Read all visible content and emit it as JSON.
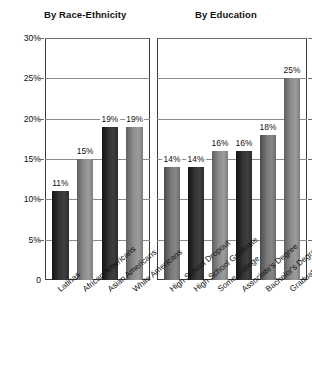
{
  "chart_data": {
    "type": "bar",
    "title": "",
    "xlabel": "",
    "ylabel": "",
    "ylim": [
      0,
      30
    ],
    "ytick_labels": [
      "30%",
      "25%",
      "20%",
      "15%",
      "10%",
      "5%",
      "0"
    ],
    "ytick_values": [
      30,
      25,
      20,
      15,
      10,
      5,
      0
    ],
    "grid": true,
    "legend": "none",
    "panels": [
      {
        "title": "By Race-Ethnicity",
        "categories": [
          "Latinas",
          "African Americans",
          "Asian Americans",
          "White Americans"
        ],
        "values": [
          11,
          15,
          19,
          19
        ],
        "value_labels": [
          "11%",
          "15%",
          "19%",
          "19%"
        ],
        "shades": [
          "dark",
          "light",
          "dark",
          "light"
        ]
      },
      {
        "title": "By Education",
        "categories": [
          "High School Dropout",
          "High School Graduate",
          "Some College",
          "Associate's Degree",
          "Bachelor's Degree",
          "Graduate Degree"
        ],
        "values": [
          14,
          14,
          16,
          16,
          18,
          25
        ],
        "value_labels": [
          "14%",
          "14%",
          "16%",
          "16%",
          "18%",
          "25%"
        ],
        "shades": [
          "mid",
          "dark",
          "light",
          "dark",
          "mid",
          "light"
        ]
      }
    ]
  },
  "colors": {
    "background": "#ffffff",
    "axis": "#3b3b3b",
    "gridline": "#8c8c8c",
    "text": "#111111",
    "bar_dark": "#2e2e2e",
    "bar_mid": "#6a6a6a",
    "bar_light": "#8e8e8e"
  }
}
